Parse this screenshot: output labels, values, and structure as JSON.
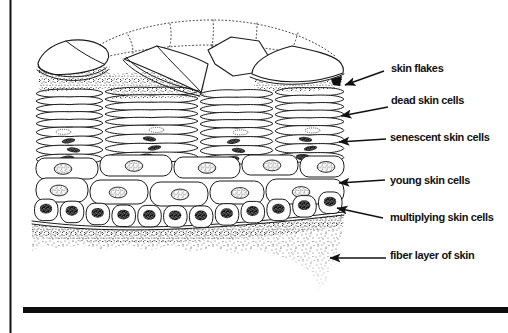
{
  "figure": {
    "colors": {
      "ink": "#1a1a1a",
      "paper": "#ffffff"
    },
    "labels": [
      {
        "id": "skin-flakes",
        "text": "skin flakes"
      },
      {
        "id": "dead-skin-cells",
        "text": "dead skin cells"
      },
      {
        "id": "senescent-skin-cells",
        "text": "senescent skin cells"
      },
      {
        "id": "young-skin-cells",
        "text": "young skin cells"
      },
      {
        "id": "multiplying-skin-cells",
        "text": "multiplying skin cells"
      },
      {
        "id": "fiber-layer-of-skin",
        "text": "fiber layer of skin"
      }
    ]
  }
}
